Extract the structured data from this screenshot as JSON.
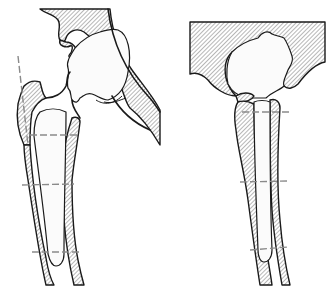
{
  "figure": {
    "panels": [
      {
        "name": "left-panel",
        "subject": "hip-joint-with-femoral-stem",
        "reference_lines": 3,
        "has_vertical_axis_line": true
      },
      {
        "name": "right-panel",
        "subject": "hip-joint-with-short-femoral-stem",
        "reference_lines": 3,
        "has_vertical_axis_line": false
      }
    ],
    "colors": {
      "outline": "#1a1a1a",
      "hatch": "#6f6f6f",
      "reference_line": "#8a8a8a",
      "background": "#ffffff"
    }
  }
}
